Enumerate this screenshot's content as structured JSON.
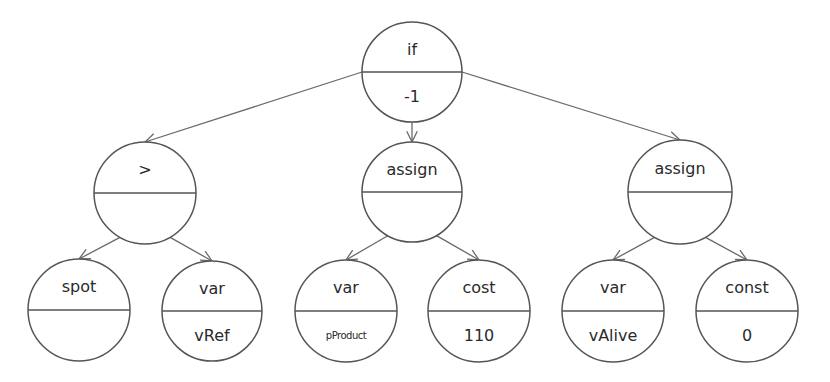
{
  "diagram": {
    "type": "expression-tree",
    "nodes": [
      {
        "id": "root",
        "top": "if",
        "bottom": "-1",
        "cx": 412,
        "cy": 72,
        "r": 50
      },
      {
        "id": "gt",
        "top": ">",
        "bottom": "",
        "cx": 145,
        "cy": 193,
        "r": 51
      },
      {
        "id": "assign1",
        "top": "assign",
        "bottom": "",
        "cx": 412,
        "cy": 192,
        "r": 50
      },
      {
        "id": "assign2",
        "top": "assign",
        "bottom": "",
        "cx": 680,
        "cy": 192,
        "r": 52
      },
      {
        "id": "spot",
        "top": "spot",
        "bottom": "",
        "cx": 79,
        "cy": 310,
        "r": 51
      },
      {
        "id": "varRef",
        "top": "var",
        "bottom": "vRef",
        "cx": 212,
        "cy": 311,
        "r": 50
      },
      {
        "id": "varProd",
        "top": "var",
        "bottom": "pProduct",
        "cx": 346,
        "cy": 311,
        "r": 51,
        "small": true
      },
      {
        "id": "cost",
        "top": "cost",
        "bottom": "110",
        "cx": 479,
        "cy": 311,
        "r": 51
      },
      {
        "id": "varAlive",
        "top": "var",
        "bottom": "vAlive",
        "cx": 613,
        "cy": 311,
        "r": 51
      },
      {
        "id": "const",
        "top": "const",
        "bottom": "0",
        "cx": 747,
        "cy": 311,
        "r": 51
      }
    ],
    "edges": [
      {
        "from": "root",
        "to": "gt"
      },
      {
        "from": "root",
        "to": "assign1"
      },
      {
        "from": "root",
        "to": "assign2"
      },
      {
        "from": "gt",
        "to": "spot"
      },
      {
        "from": "gt",
        "to": "varRef"
      },
      {
        "from": "assign1",
        "to": "varProd"
      },
      {
        "from": "assign1",
        "to": "cost"
      },
      {
        "from": "assign2",
        "to": "varAlive"
      },
      {
        "from": "assign2",
        "to": "const"
      }
    ]
  }
}
